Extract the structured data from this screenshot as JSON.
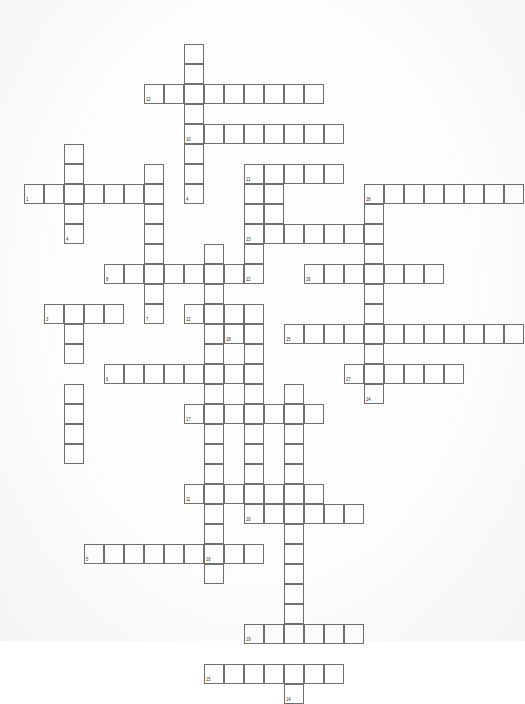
{
  "document": {
    "kind": "crossword-puzzle-grid",
    "title": "",
    "background_color": "#ffffff",
    "cell_border_color": "#6f6f6f",
    "cell_fill_color": "#ffffff",
    "cell_size_px": 20,
    "grid_origin": {
      "x": 24,
      "y": 44
    },
    "columns": 25,
    "rows": 30
  },
  "grid": {
    "description": "Each entry: column index, row index (0-based from grid origin), optional clue number shown in the cell's lower-left corner.",
    "entries": [
      {
        "across": [],
        "down": []
      }
    ],
    "words": [
      {
        "number": "12",
        "direction": "across",
        "col": 6,
        "row": 1,
        "length": 9
      },
      {
        "number": "10",
        "direction": "down",
        "col": 8,
        "row": -1,
        "length": 8
      },
      {
        "number": "20",
        "direction": "across",
        "col": 8,
        "row": 3,
        "length": 8
      },
      {
        "number": "1",
        "direction": "across",
        "col": 0,
        "row": 6,
        "length": 6
      },
      {
        "number": "2",
        "direction": "down",
        "col": 2,
        "row": 4,
        "length": 5
      },
      {
        "number": "21",
        "direction": "across",
        "col": 11,
        "row": 5,
        "length": 5
      },
      {
        "number": "28",
        "direction": "across",
        "col": 17,
        "row": 6,
        "length": 8
      },
      {
        "number": "23",
        "direction": "across",
        "col": 12,
        "row": 8,
        "length": 6
      },
      {
        "number": "8",
        "direction": "across",
        "col": 4,
        "row": 9,
        "length": 10
      },
      {
        "number": "9",
        "direction": "down",
        "col": 6,
        "row": 5,
        "length": 8
      },
      {
        "number": "22",
        "direction": "down",
        "col": 12,
        "row": 5,
        "length": 6
      },
      {
        "number": "26",
        "direction": "across",
        "col": 15,
        "row": 9,
        "length": 7
      },
      {
        "number": "3",
        "direction": "across",
        "col": 1,
        "row": 11,
        "length": 4
      },
      {
        "number": "7",
        "direction": "down",
        "col": 2,
        "row": 10,
        "length": 7
      },
      {
        "number": "13",
        "direction": "down",
        "col": 8,
        "row": 10,
        "length": 6
      },
      {
        "number": "18",
        "direction": "down",
        "col": 10,
        "row": 11,
        "length": 4
      },
      {
        "number": "25",
        "direction": "across",
        "col": 14,
        "row": 12,
        "length": 11
      },
      {
        "number": "6",
        "direction": "across",
        "col": 4,
        "row": 14,
        "length": 7
      },
      {
        "number": "17",
        "direction": "across",
        "col": 8,
        "row": 15,
        "length": 6
      },
      {
        "number": "27",
        "direction": "across",
        "col": 17,
        "row": 15,
        "length": 6
      },
      {
        "number": "24",
        "direction": "down",
        "col": 18,
        "row": 16,
        "length": 2
      },
      {
        "number": "11",
        "direction": "across",
        "col": 8,
        "row": 18,
        "length": 7
      },
      {
        "number": "20",
        "direction": "down",
        "col": 11,
        "row": 17,
        "length": 6
      },
      {
        "number": "5",
        "direction": "across",
        "col": 4,
        "row": 21,
        "length": 8
      },
      {
        "number": "16",
        "direction": "down",
        "col": 9,
        "row": 19,
        "length": 5
      },
      {
        "number": "19",
        "direction": "across",
        "col": 11,
        "row": 25,
        "length": 6
      },
      {
        "number": "15",
        "direction": "across",
        "col": 9,
        "row": 27,
        "length": 7
      },
      {
        "number": "14",
        "direction": "down",
        "col": 13,
        "row": 17,
        "length": 11
      }
    ]
  },
  "cells": [
    {
      "c": 8,
      "r": 0
    },
    {
      "c": 8,
      "r": 1
    },
    {
      "c": 6,
      "r": 2,
      "n": "12"
    },
    {
      "c": 7,
      "r": 2
    },
    {
      "c": 8,
      "r": 2
    },
    {
      "c": 9,
      "r": 2
    },
    {
      "c": 10,
      "r": 2
    },
    {
      "c": 11,
      "r": 2
    },
    {
      "c": 12,
      "r": 2
    },
    {
      "c": 13,
      "r": 2
    },
    {
      "c": 14,
      "r": 2
    },
    {
      "c": 8,
      "r": 3
    },
    {
      "c": 8,
      "r": 4,
      "n": "10"
    },
    {
      "c": 9,
      "r": 4
    },
    {
      "c": 10,
      "r": 4
    },
    {
      "c": 11,
      "r": 4
    },
    {
      "c": 12,
      "r": 4
    },
    {
      "c": 13,
      "r": 4
    },
    {
      "c": 14,
      "r": 4
    },
    {
      "c": 15,
      "r": 4
    },
    {
      "c": 2,
      "r": 5
    },
    {
      "c": 8,
      "r": 5
    },
    {
      "c": 2,
      "r": 6
    },
    {
      "c": 6,
      "r": 6
    },
    {
      "c": 8,
      "r": 6
    },
    {
      "c": 11,
      "r": 6,
      "n": "21"
    },
    {
      "c": 12,
      "r": 6
    },
    {
      "c": 13,
      "r": 6
    },
    {
      "c": 14,
      "r": 6
    },
    {
      "c": 15,
      "r": 6
    },
    {
      "c": 0,
      "r": 7,
      "n": "1"
    },
    {
      "c": 1,
      "r": 7
    },
    {
      "c": 2,
      "r": 7
    },
    {
      "c": 3,
      "r": 7
    },
    {
      "c": 4,
      "r": 7
    },
    {
      "c": 5,
      "r": 7
    },
    {
      "c": 6,
      "r": 7
    },
    {
      "c": 8,
      "r": 7,
      "n": "4"
    },
    {
      "c": 11,
      "r": 7
    },
    {
      "c": 12,
      "r": 7
    },
    {
      "c": 17,
      "r": 7,
      "n": "28"
    },
    {
      "c": 18,
      "r": 7
    },
    {
      "c": 19,
      "r": 7
    },
    {
      "c": 20,
      "r": 7
    },
    {
      "c": 21,
      "r": 7
    },
    {
      "c": 22,
      "r": 7
    },
    {
      "c": 23,
      "r": 7
    },
    {
      "c": 24,
      "r": 7
    },
    {
      "c": 2,
      "r": 8
    },
    {
      "c": 6,
      "r": 8
    },
    {
      "c": 11,
      "r": 8
    },
    {
      "c": 12,
      "r": 8
    },
    {
      "c": 17,
      "r": 8
    },
    {
      "c": 2,
      "r": 9,
      "n": "4"
    },
    {
      "c": 6,
      "r": 9
    },
    {
      "c": 11,
      "r": 9,
      "n": "23"
    },
    {
      "c": 12,
      "r": 9
    },
    {
      "c": 13,
      "r": 9
    },
    {
      "c": 14,
      "r": 9
    },
    {
      "c": 15,
      "r": 9
    },
    {
      "c": 16,
      "r": 9
    },
    {
      "c": 17,
      "r": 9
    },
    {
      "c": 6,
      "r": 10
    },
    {
      "c": 9,
      "r": 10
    },
    {
      "c": 11,
      "r": 10
    },
    {
      "c": 17,
      "r": 10
    },
    {
      "c": 4,
      "r": 11,
      "n": "8"
    },
    {
      "c": 5,
      "r": 11
    },
    {
      "c": 6,
      "r": 11
    },
    {
      "c": 7,
      "r": 11
    },
    {
      "c": 8,
      "r": 11
    },
    {
      "c": 9,
      "r": 11
    },
    {
      "c": 10,
      "r": 11
    },
    {
      "c": 11,
      "r": 11,
      "n": "22"
    },
    {
      "c": 14,
      "r": 11,
      "n": "26"
    },
    {
      "c": 15,
      "r": 11
    },
    {
      "c": 16,
      "r": 11
    },
    {
      "c": 17,
      "r": 11
    },
    {
      "c": 18,
      "r": 11
    },
    {
      "c": 19,
      "r": 11
    },
    {
      "c": 20,
      "r": 11
    },
    {
      "c": 6,
      "r": 12
    },
    {
      "c": 9,
      "r": 12
    },
    {
      "c": 17,
      "r": 12
    },
    {
      "c": 1,
      "r": 13,
      "n": "3"
    },
    {
      "c": 2,
      "r": 13
    },
    {
      "c": 3,
      "r": 13
    },
    {
      "c": 4,
      "r": 13
    },
    {
      "c": 6,
      "r": 13,
      "n": "7"
    },
    {
      "c": 8,
      "r": 13,
      "n": "12"
    },
    {
      "c": 9,
      "r": 13
    },
    {
      "c": 10,
      "r": 13
    },
    {
      "c": 11,
      "r": 13
    },
    {
      "c": 17,
      "r": 13
    },
    {
      "c": 2,
      "r": 14
    },
    {
      "c": 9,
      "r": 14
    },
    {
      "c": 10,
      "r": 14,
      "n": "18"
    },
    {
      "c": 11,
      "r": 14
    },
    {
      "c": 13,
      "r": 14,
      "n": "25"
    },
    {
      "c": 14,
      "r": 14
    },
    {
      "c": 15,
      "r": 14
    },
    {
      "c": 16,
      "r": 14
    },
    {
      "c": 17,
      "r": 14
    },
    {
      "c": 18,
      "r": 14
    },
    {
      "c": 19,
      "r": 14
    },
    {
      "c": 20,
      "r": 14
    },
    {
      "c": 21,
      "r": 14
    },
    {
      "c": 22,
      "r": 14
    },
    {
      "c": 23,
      "r": 14
    },
    {
      "c": 24,
      "r": 14
    },
    {
      "c": 2,
      "r": 15
    },
    {
      "c": 9,
      "r": 15
    },
    {
      "c": 11,
      "r": 15
    },
    {
      "c": 17,
      "r": 15
    },
    {
      "c": 4,
      "r": 16,
      "n": "6"
    },
    {
      "c": 5,
      "r": 16
    },
    {
      "c": 6,
      "r": 16
    },
    {
      "c": 7,
      "r": 16
    },
    {
      "c": 8,
      "r": 16
    },
    {
      "c": 9,
      "r": 16
    },
    {
      "c": 10,
      "r": 16
    },
    {
      "c": 11,
      "r": 16
    },
    {
      "c": 16,
      "r": 16,
      "n": "27"
    },
    {
      "c": 17,
      "r": 16
    },
    {
      "c": 18,
      "r": 16
    },
    {
      "c": 19,
      "r": 16
    },
    {
      "c": 20,
      "r": 16
    },
    {
      "c": 21,
      "r": 16
    },
    {
      "c": 2,
      "r": 17
    },
    {
      "c": 9,
      "r": 17
    },
    {
      "c": 11,
      "r": 17
    },
    {
      "c": 13,
      "r": 17
    },
    {
      "c": 17,
      "r": 17,
      "n": "24"
    },
    {
      "c": 2,
      "r": 18
    },
    {
      "c": 8,
      "r": 18,
      "n": "17"
    },
    {
      "c": 9,
      "r": 18
    },
    {
      "c": 10,
      "r": 18
    },
    {
      "c": 11,
      "r": 18
    },
    {
      "c": 12,
      "r": 18
    },
    {
      "c": 13,
      "r": 18
    },
    {
      "c": 14,
      "r": 18
    },
    {
      "c": 2,
      "r": 19
    },
    {
      "c": 9,
      "r": 19
    },
    {
      "c": 11,
      "r": 19
    },
    {
      "c": 13,
      "r": 19
    },
    {
      "c": 2,
      "r": 20
    },
    {
      "c": 9,
      "r": 20
    },
    {
      "c": 11,
      "r": 20
    },
    {
      "c": 13,
      "r": 20
    },
    {
      "c": 9,
      "r": 21
    },
    {
      "c": 11,
      "r": 21
    },
    {
      "c": 13,
      "r": 21
    },
    {
      "c": 8,
      "r": 22,
      "n": "11"
    },
    {
      "c": 9,
      "r": 22
    },
    {
      "c": 10,
      "r": 22
    },
    {
      "c": 11,
      "r": 22
    },
    {
      "c": 12,
      "r": 22
    },
    {
      "c": 13,
      "r": 22
    },
    {
      "c": 14,
      "r": 22
    },
    {
      "c": 9,
      "r": 23
    },
    {
      "c": 11,
      "r": 23,
      "n": "20"
    },
    {
      "c": 12,
      "r": 23
    },
    {
      "c": 13,
      "r": 23
    },
    {
      "c": 14,
      "r": 23
    },
    {
      "c": 15,
      "r": 23
    },
    {
      "c": 16,
      "r": 23
    },
    {
      "c": 9,
      "r": 24
    },
    {
      "c": 13,
      "r": 24
    },
    {
      "c": 3,
      "r": 25,
      "n": "5"
    },
    {
      "c": 4,
      "r": 25
    },
    {
      "c": 5,
      "r": 25
    },
    {
      "c": 6,
      "r": 25
    },
    {
      "c": 7,
      "r": 25
    },
    {
      "c": 8,
      "r": 25
    },
    {
      "c": 9,
      "r": 25,
      "n": "16"
    },
    {
      "c": 10,
      "r": 25
    },
    {
      "c": 11,
      "r": 25
    },
    {
      "c": 13,
      "r": 25
    },
    {
      "c": 9,
      "r": 26
    },
    {
      "c": 13,
      "r": 26
    },
    {
      "c": 13,
      "r": 27
    },
    {
      "c": 13,
      "r": 28
    },
    {
      "c": 11,
      "r": 29,
      "n": "19"
    },
    {
      "c": 12,
      "r": 29
    },
    {
      "c": 13,
      "r": 29
    },
    {
      "c": 14,
      "r": 29
    },
    {
      "c": 15,
      "r": 29
    },
    {
      "c": 16,
      "r": 29
    },
    {
      "c": 9,
      "r": 31,
      "n": "15"
    },
    {
      "c": 10,
      "r": 31
    },
    {
      "c": 11,
      "r": 31
    },
    {
      "c": 12,
      "r": 31
    },
    {
      "c": 13,
      "r": 31
    },
    {
      "c": 14,
      "r": 31
    },
    {
      "c": 15,
      "r": 31
    },
    {
      "c": 13,
      "r": 32,
      "n": "14"
    }
  ]
}
